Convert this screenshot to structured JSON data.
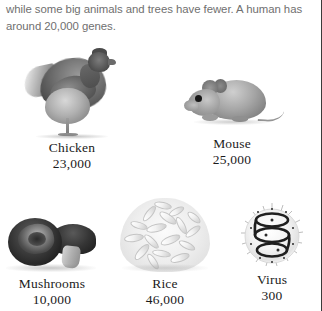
{
  "page": {
    "background_color": "#ffffff",
    "text_color": "#6f6f6f",
    "caption_color": "#1b1b1b"
  },
  "body_text": {
    "paragraph": "while some big animals and trees have fewer. A human has around 20,000 genes."
  },
  "figure": {
    "items": [
      {
        "id": "chicken",
        "label": "Chicken",
        "value": "23,000",
        "image": "chicken-photo"
      },
      {
        "id": "mouse",
        "label": "Mouse",
        "value": "25,000",
        "image": "mouse-photo"
      },
      {
        "id": "mushrooms",
        "label": "Mushrooms",
        "value": "10,000",
        "image": "mushrooms-photo"
      },
      {
        "id": "rice",
        "label": "Rice",
        "value": "46,000",
        "image": "rice-photo"
      },
      {
        "id": "virus",
        "label": "Virus",
        "value": "300",
        "image": "virus-photo"
      }
    ]
  }
}
